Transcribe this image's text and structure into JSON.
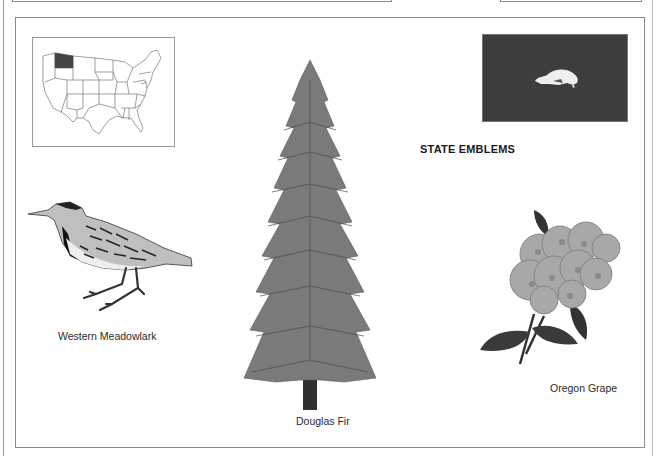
{
  "page": {
    "heading": "STATE EMBLEMS",
    "map": {
      "description": "Map of the United States with Oregon highlighted",
      "highlighted_state": "Oregon",
      "highlight_color": "#444444"
    },
    "flag": {
      "description": "State flag reverse side with beaver",
      "background_color": "#3d3d3d",
      "emblem": "beaver"
    },
    "emblems": [
      {
        "type": "bird",
        "caption": "Western Meadowlark"
      },
      {
        "type": "tree",
        "caption": "Douglas Fir"
      },
      {
        "type": "flower",
        "caption": "Oregon Grape"
      }
    ]
  }
}
